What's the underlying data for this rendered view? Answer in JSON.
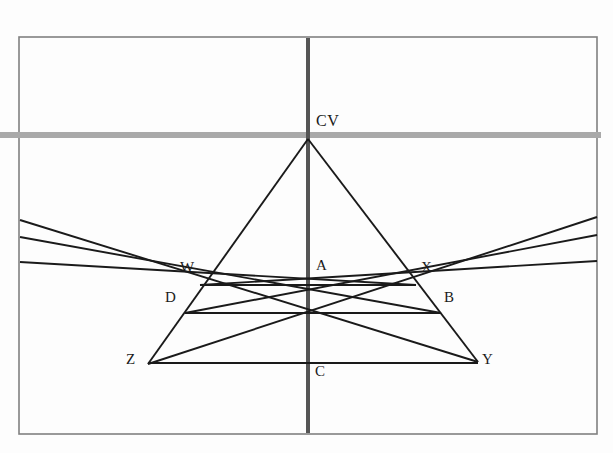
{
  "diagram": {
    "type": "perspective-construction",
    "canvas": {
      "width": 613,
      "height": 453,
      "background": "#fdfdfd"
    },
    "frame": {
      "name": "picture-plane-frame",
      "x": 19,
      "y": 37,
      "width": 578,
      "height": 397,
      "stroke": "#808080",
      "stroke_width": 1.6
    },
    "colors": {
      "horizon": "#a9a9a9",
      "center_line": "#555555",
      "construction": "#1a1a1a",
      "frame": "#808080"
    },
    "horizon_line": {
      "name": "horizon-line",
      "label": "",
      "y": 135,
      "x1": 0,
      "x2": 601,
      "stroke": "#a9a9a9",
      "stroke_width": 6
    },
    "center_line": {
      "name": "central-vertical-axis",
      "x": 308,
      "y1": 38,
      "y2": 433,
      "stroke": "#555555",
      "stroke_width": 4
    },
    "points": [
      {
        "id": "CV",
        "label": "CV",
        "x": 308,
        "y": 135,
        "label_x": 316,
        "label_y": 113,
        "role": "center-of-vision"
      },
      {
        "id": "A",
        "label": "A",
        "x": 308,
        "y": 285,
        "label_x": 316,
        "label_y": 258,
        "role": "near-square-far-edge-midpoint"
      },
      {
        "id": "W",
        "label": "W",
        "x": 200,
        "y": 285,
        "label_x": 180,
        "label_y": 260,
        "role": "far-left-corner"
      },
      {
        "id": "X",
        "label": "X",
        "x": 416,
        "y": 285,
        "label_x": 421,
        "label_y": 260,
        "role": "far-right-corner"
      },
      {
        "id": "D",
        "label": "D",
        "x": 185,
        "y": 313,
        "label_x": 165,
        "label_y": 290,
        "role": "mid-left-corner"
      },
      {
        "id": "B",
        "label": "B",
        "x": 441,
        "y": 313,
        "label_x": 444,
        "label_y": 290,
        "role": "mid-right-corner"
      },
      {
        "id": "Z",
        "label": "Z",
        "x": 148,
        "y": 364,
        "label_x": 126,
        "label_y": 352,
        "role": "near-left-corner"
      },
      {
        "id": "Y",
        "label": "Y",
        "x": 478,
        "y": 362,
        "label_x": 482,
        "label_y": 352,
        "role": "near-right-corner"
      },
      {
        "id": "C",
        "label": "C",
        "x": 308,
        "y": 363,
        "label_x": 315,
        "label_y": 364,
        "role": "near-edge-midpoint"
      }
    ],
    "converging_lines": [
      {
        "name": "cv-to-z",
        "from": "CV",
        "to": "Z",
        "x1": 308,
        "y1": 139,
        "x2": 148,
        "y2": 364
      },
      {
        "name": "cv-to-y",
        "from": "CV",
        "to": "Y",
        "x1": 308,
        "y1": 139,
        "x2": 478,
        "y2": 362
      }
    ],
    "horizontal_rails": [
      {
        "name": "rail-wx",
        "y": 285,
        "x1": 200,
        "x2": 416
      },
      {
        "name": "rail-db",
        "y": 313,
        "x1": 185,
        "x2": 441
      },
      {
        "name": "rail-zy",
        "y": 363,
        "x1": 148,
        "x2": 478
      }
    ],
    "diagonal_lines": [
      {
        "name": "diagonal-from-left-edge-upper",
        "x1": 20,
        "y1": 220,
        "x2": 478,
        "y2": 362
      },
      {
        "name": "diagonal-from-left-edge-middle",
        "x1": 20,
        "y1": 237,
        "x2": 441,
        "y2": 313
      },
      {
        "name": "diagonal-from-left-edge-lower",
        "x1": 20,
        "y1": 262,
        "x2": 416,
        "y2": 285
      },
      {
        "name": "diagonal-from-right-edge-upper",
        "x1": 597,
        "y1": 217,
        "x2": 148,
        "y2": 364
      },
      {
        "name": "diagonal-from-right-edge-middle",
        "x1": 597,
        "y1": 235,
        "x2": 185,
        "y2": 313
      },
      {
        "name": "diagonal-from-right-edge-lower",
        "x1": 597,
        "y1": 261,
        "x2": 200,
        "y2": 285
      }
    ]
  }
}
